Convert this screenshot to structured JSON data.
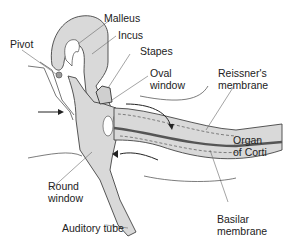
{
  "diagram": {
    "type": "middle ear / cochlea anatomy",
    "labels": {
      "malleus": "Malleus",
      "incus": "Incus",
      "pivot": "Pivot",
      "stapes": "Stapes",
      "oval_window_1": "Oval",
      "oval_window_2": "window",
      "reissners_1": "Reissner's",
      "reissners_2": "membrane",
      "organ_1": "Organ",
      "organ_2": "of Corti",
      "round_window_1": "Round",
      "round_window_2": "window",
      "auditory_tube": "Auditory tube",
      "basilar_1": "Basilar",
      "basilar_2": "membrane"
    },
    "colors": {
      "fill": "#d9d9d9",
      "stroke": "#444444",
      "dark_band": "#555555"
    }
  }
}
